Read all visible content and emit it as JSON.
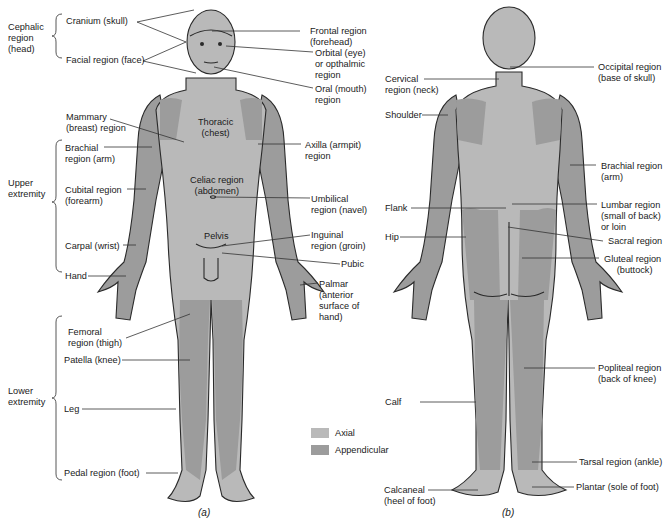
{
  "figure": {
    "colors": {
      "axial": "#b9b9b9",
      "appendicular": "#9c9c9c",
      "outline": "#2a2a2a",
      "leader_line": "#333333",
      "background": "#ffffff"
    },
    "anterior": {
      "caption": "(a)",
      "groups": [
        {
          "label": "Cephalic\nregion\n(head)",
          "members": [
            "Cranium (skull)",
            "Facial region (face)"
          ]
        },
        {
          "label": "Upper\nextremity",
          "members": [
            "Brachial region (arm)",
            "Cubital region (forearm)",
            "Carpal (wrist)",
            "Hand"
          ]
        },
        {
          "label": "Lower\nextremity",
          "members": [
            "Femoral region (thigh)",
            "Patella (knee)",
            "Leg",
            "Pedal region (foot)"
          ]
        }
      ],
      "left_labels": [
        {
          "id": "cranium",
          "text": "Cranium (skull)"
        },
        {
          "id": "facial",
          "text": "Facial region (face)"
        },
        {
          "id": "mammary",
          "text": "Mammary\n(breast) region"
        },
        {
          "id": "brachial",
          "text": "Brachial\nregion (arm)"
        },
        {
          "id": "cubital",
          "text": "Cubital region\n(forearm)"
        },
        {
          "id": "carpal",
          "text": "Carpal (wrist)"
        },
        {
          "id": "hand",
          "text": "Hand"
        },
        {
          "id": "femoral",
          "text": "Femoral\nregion (thigh)"
        },
        {
          "id": "patella",
          "text": "Patella (knee)"
        },
        {
          "id": "leg",
          "text": "Leg"
        },
        {
          "id": "pedal",
          "text": "Pedal region (foot)"
        }
      ],
      "inner_labels": [
        {
          "id": "thoracic",
          "text": "Thoracic\n(chest)"
        },
        {
          "id": "celiac",
          "text": "Celiac region\n(abdomen)"
        },
        {
          "id": "pelvis",
          "text": "Pelvis"
        }
      ],
      "right_labels": [
        {
          "id": "frontal",
          "text": "Frontal region\n(forehead)"
        },
        {
          "id": "orbital",
          "text": "Orbital (eye)\nor opthalmic\nregion"
        },
        {
          "id": "oral",
          "text": "Oral (mouth)\nregion"
        },
        {
          "id": "axilla",
          "text": "Axilla (armpit)\nregion"
        },
        {
          "id": "umbilical",
          "text": "Umbilical\nregion (navel)"
        },
        {
          "id": "inguinal",
          "text": "Inguinal\nregion (groin)"
        },
        {
          "id": "pubic",
          "text": "Pubic"
        },
        {
          "id": "palmar",
          "text": "Palmar\n(anterior\nsurface of\nhand)"
        }
      ]
    },
    "posterior": {
      "caption": "(b)",
      "left_labels": [
        {
          "id": "cervical",
          "text": "Cervical\nregion (neck)"
        },
        {
          "id": "shoulder",
          "text": "Shoulder"
        },
        {
          "id": "flank",
          "text": "Flank"
        },
        {
          "id": "hip",
          "text": "Hip"
        },
        {
          "id": "calf",
          "text": "Calf"
        },
        {
          "id": "calcaneal",
          "text": "Calcaneal\n(heel of foot)"
        }
      ],
      "right_labels": [
        {
          "id": "occipital",
          "text": "Occipital region\n(base of skull)"
        },
        {
          "id": "brachial_b",
          "text": "Brachial region\n(arm)"
        },
        {
          "id": "lumbar",
          "text": "Lumbar region\n(small of back)\nor loin"
        },
        {
          "id": "sacral",
          "text": "Sacral region"
        },
        {
          "id": "gluteal",
          "text": "Gluteal region\n     (buttock)"
        },
        {
          "id": "popliteal",
          "text": "Popliteal region\n(back of knee)"
        },
        {
          "id": "tarsal",
          "text": "Tarsal region (ankle)"
        },
        {
          "id": "plantar",
          "text": "Plantar (sole of foot)"
        }
      ]
    },
    "legend": [
      {
        "label": "Axial",
        "color": "#b9b9b9"
      },
      {
        "label": "Appendicular",
        "color": "#9c9c9c"
      }
    ]
  }
}
